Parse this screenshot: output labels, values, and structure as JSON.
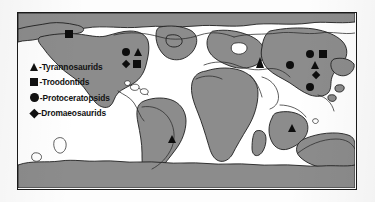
{
  "figure": {
    "type": "paleogeographic-distribution-map",
    "frame_color": "#1a1a1a",
    "ocean_color": "#ffffff",
    "land_color": "#8c8c8c",
    "land_outline_color": "#1f1f1f",
    "modern_coastline_color": "#2a2a2a",
    "marker_color": "#0d0d0d"
  },
  "legend": {
    "items": [
      {
        "symbol": "triangle",
        "icon_name": "triangle-marker-icon",
        "label": "-Tyrannosaurids"
      },
      {
        "symbol": "square",
        "icon_name": "square-marker-icon",
        "label": "-Troodontids"
      },
      {
        "symbol": "circle",
        "icon_name": "circle-marker-icon",
        "label": "-Protoceratopsids"
      },
      {
        "symbol": "diamond",
        "icon_name": "diamond-marker-icon",
        "label": "-Dromaeosaurids"
      }
    ]
  },
  "markers": [
    {
      "id": "alaska-troodontid",
      "symbol": "square",
      "region": "Alaska",
      "x": 47,
      "y": 17
    },
    {
      "id": "na-protoceratopsid",
      "symbol": "circle",
      "region": "North America",
      "x": 104,
      "y": 35
    },
    {
      "id": "na-tyrannosaurid",
      "symbol": "triangle",
      "region": "North America",
      "x": 116,
      "y": 35
    },
    {
      "id": "na-dromaeosaurid",
      "symbol": "diamond",
      "region": "North America",
      "x": 105,
      "y": 48
    },
    {
      "id": "na-troodontid",
      "symbol": "square",
      "region": "North America",
      "x": 115,
      "y": 47
    },
    {
      "id": "centralasia-tyrannosaurid",
      "symbol": "triangle",
      "region": "Central Asia",
      "x": 238,
      "y": 44
    },
    {
      "id": "asia-protoceratopsid-n",
      "symbol": "circle",
      "region": "East Asia",
      "x": 288,
      "y": 37
    },
    {
      "id": "asia-troodontid",
      "symbol": "square",
      "region": "East Asia",
      "x": 301,
      "y": 37
    },
    {
      "id": "asia-protoceratopsid-w",
      "symbol": "circle",
      "region": "East Asia",
      "x": 268,
      "y": 48
    },
    {
      "id": "asia-tyrannosaurid",
      "symbol": "triangle",
      "region": "East Asia",
      "x": 293,
      "y": 48
    },
    {
      "id": "asia-dromaeosaurid",
      "symbol": "diamond",
      "region": "East Asia",
      "x": 295,
      "y": 59
    },
    {
      "id": "asia-protoceratopsid-s",
      "symbol": "circle",
      "region": "East Asia",
      "x": 288,
      "y": 70
    },
    {
      "id": "india-tyrannosaurid",
      "symbol": "triangle",
      "region": "India",
      "x": 270,
      "y": 111
    },
    {
      "id": "southamerica-tyrannosaurid",
      "symbol": "triangle",
      "region": "South America",
      "x": 150,
      "y": 122
    }
  ]
}
